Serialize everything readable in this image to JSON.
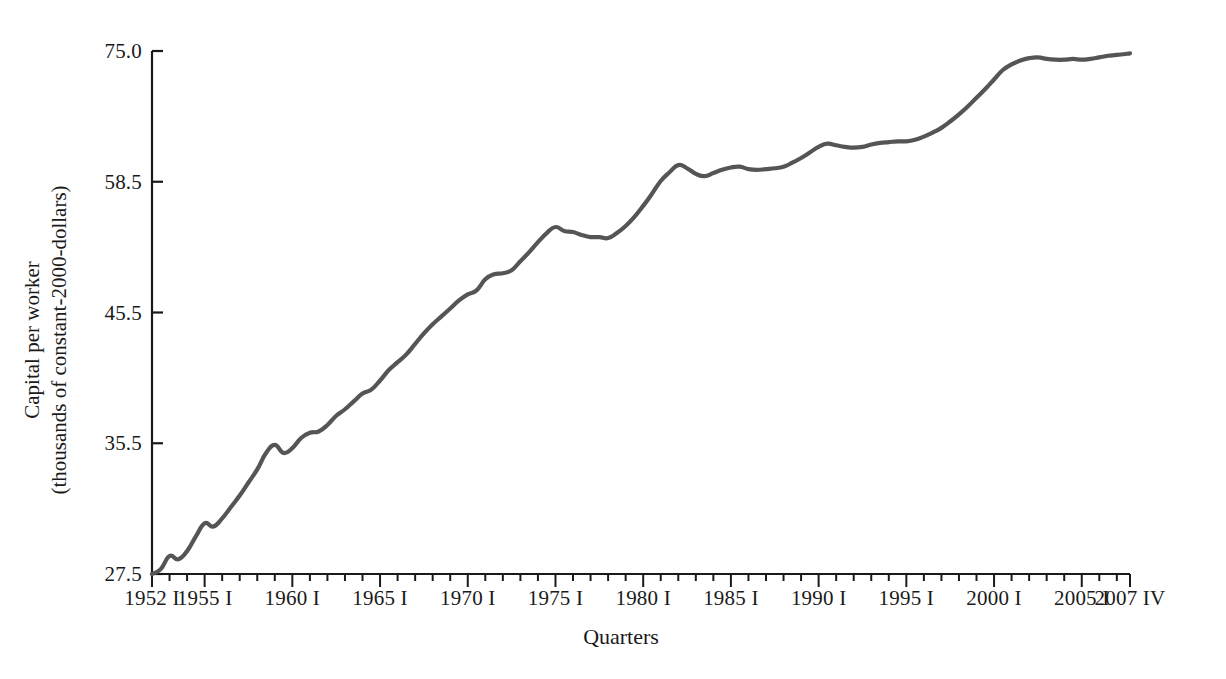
{
  "chart_data": {
    "type": "line",
    "title": "",
    "xlabel": "Quarters",
    "ylabel": "Capital per worker (thousands of constant-2000-dollars)",
    "ylabel_lines": [
      "Capital per worker",
      "(thousands of constant-2000-dollars)"
    ],
    "grid": false,
    "legend": "none",
    "line_color": "#555555",
    "axis_color": "#1a1a1a",
    "background_color": "#ffffff",
    "y_ticks": [
      "27.5",
      "35.5",
      "45.5",
      "58.5",
      "75.0"
    ],
    "y_tick_values": [
      27.5,
      35.5,
      45.5,
      58.5,
      75.0
    ],
    "ylim": [
      27.5,
      75.0
    ],
    "y_scale_note": "equal pixel spacing between listed ticks (logarithmic-style spacing)",
    "x_ticks_major": [
      "1952 I",
      "1955 I",
      "1960 I",
      "1965 I",
      "1970 I",
      "1975 I",
      "1980 I",
      "1985 I",
      "1990 I",
      "1995 I",
      "2000 I",
      "2005 I",
      "2007 IV"
    ],
    "x_tick_years": [
      1952,
      1955,
      1960,
      1965,
      1970,
      1975,
      1980,
      1985,
      1990,
      1995,
      2000,
      2005,
      2007.75
    ],
    "x_minor_tick_interval_years": 1,
    "xlim": [
      1952,
      2007.75
    ],
    "series": [
      {
        "name": "Capital per worker",
        "x": [
          1952.0,
          1952.5,
          1953.0,
          1953.5,
          1954.0,
          1954.5,
          1955.0,
          1955.5,
          1956.0,
          1956.5,
          1957.0,
          1957.5,
          1958.0,
          1958.5,
          1959.0,
          1959.5,
          1960.0,
          1960.5,
          1961.0,
          1961.5,
          1962.0,
          1962.5,
          1963.0,
          1963.5,
          1964.0,
          1964.5,
          1965.0,
          1965.5,
          1966.0,
          1966.5,
          1967.0,
          1967.5,
          1968.0,
          1968.5,
          1969.0,
          1969.5,
          1970.0,
          1970.5,
          1971.0,
          1971.5,
          1972.0,
          1972.5,
          1973.0,
          1973.5,
          1974.0,
          1974.5,
          1975.0,
          1975.5,
          1976.0,
          1976.5,
          1977.0,
          1977.5,
          1978.0,
          1978.5,
          1979.0,
          1979.5,
          1980.0,
          1980.5,
          1981.0,
          1981.5,
          1982.0,
          1982.5,
          1983.0,
          1983.5,
          1984.0,
          1984.5,
          1985.0,
          1985.5,
          1986.0,
          1986.5,
          1987.0,
          1987.5,
          1988.0,
          1988.5,
          1989.0,
          1989.5,
          1990.0,
          1990.5,
          1991.0,
          1991.5,
          1992.0,
          1992.5,
          1993.0,
          1993.5,
          1994.0,
          1994.5,
          1995.0,
          1995.5,
          1996.0,
          1996.5,
          1997.0,
          1997.5,
          1998.0,
          1998.5,
          1999.0,
          1999.5,
          2000.0,
          2000.5,
          2001.0,
          2001.5,
          2002.0,
          2002.5,
          2003.0,
          2003.5,
          2004.0,
          2004.5,
          2005.0,
          2005.5,
          2006.0,
          2006.5,
          2007.0,
          2007.75
        ],
        "y": [
          27.5,
          27.8,
          28.6,
          28.4,
          28.9,
          29.8,
          30.6,
          30.4,
          30.9,
          31.6,
          32.3,
          33.1,
          33.9,
          34.9,
          35.4,
          34.9,
          35.2,
          35.9,
          36.3,
          36.4,
          36.9,
          37.6,
          38.1,
          38.7,
          39.3,
          39.6,
          40.3,
          41.1,
          41.7,
          42.3,
          43.1,
          43.9,
          44.6,
          45.2,
          45.9,
          46.7,
          47.3,
          47.7,
          48.8,
          49.3,
          49.4,
          49.7,
          50.6,
          51.5,
          52.5,
          53.4,
          54.0,
          53.6,
          53.5,
          53.2,
          53.0,
          53.0,
          52.9,
          53.4,
          54.1,
          55.0,
          56.1,
          57.3,
          58.6,
          59.7,
          60.6,
          60.2,
          59.5,
          59.2,
          59.6,
          60.0,
          60.3,
          60.4,
          60.1,
          60.0,
          60.1,
          60.2,
          60.4,
          60.9,
          61.5,
          62.2,
          62.9,
          63.3,
          63.1,
          62.9,
          62.8,
          62.9,
          63.2,
          63.4,
          63.5,
          63.6,
          63.6,
          63.8,
          64.2,
          64.7,
          65.3,
          66.1,
          67.0,
          68.0,
          69.1,
          70.2,
          71.4,
          72.6,
          73.3,
          73.8,
          74.1,
          74.2,
          74.0,
          73.9,
          73.9,
          74.0,
          73.9,
          74.0,
          74.2,
          74.4,
          74.5,
          74.7
        ]
      }
    ]
  },
  "axes": {
    "y_title_line1": "Capital per worker",
    "y_title_line2": "(thousands of constant-2000-dollars)",
    "x_title": "Quarters"
  }
}
